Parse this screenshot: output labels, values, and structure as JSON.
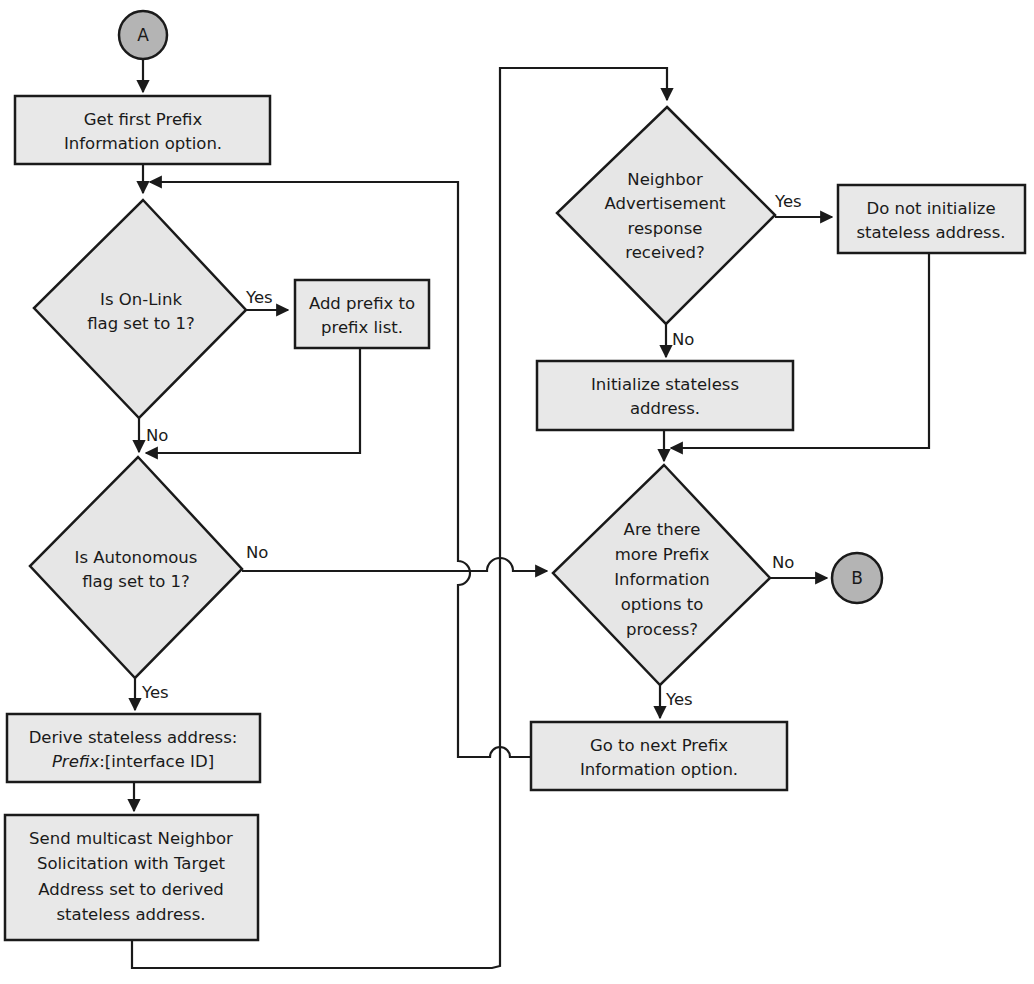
{
  "diagram": {
    "connectors": {
      "start": "A",
      "end": "B"
    },
    "nodes": {
      "get_first": [
        "Get first Prefix",
        "Information option."
      ],
      "onlink_decision": [
        "Is On-Link",
        "flag set to 1?"
      ],
      "add_prefix": [
        "Add prefix to",
        "prefix list."
      ],
      "autonomous_decision": [
        "Is Autonomous",
        "flag set to 1?"
      ],
      "derive": {
        "line1": "Derive stateless address:",
        "line2_italic": "Prefix",
        "line2_rest": ":[interface ID]"
      },
      "send_ns": [
        "Send multicast Neighbor",
        "Solicitation with Target",
        "Address set to derived",
        "stateless address."
      ],
      "na_decision": [
        "Neighbor",
        "Advertisement",
        "response",
        "received?"
      ],
      "do_not_init": [
        "Do not initialize",
        "stateless address."
      ],
      "init": [
        "Initialize stateless",
        "address."
      ],
      "more_decision": [
        "Are there",
        "more Prefix",
        "Information",
        "options to",
        "process?"
      ],
      "next_option": [
        "Go to next Prefix",
        "Information option."
      ]
    },
    "edge_labels": {
      "onlink_yes": "Yes",
      "onlink_no": "No",
      "autonomous_no": "No",
      "autonomous_yes": "Yes",
      "na_yes": "Yes",
      "na_no": "No",
      "more_no": "No",
      "more_yes": "Yes"
    },
    "colors": {
      "box_fill": "#e8e8e8",
      "connector_fill": "#b4b4b4",
      "stroke": "#1a1a1a"
    }
  }
}
